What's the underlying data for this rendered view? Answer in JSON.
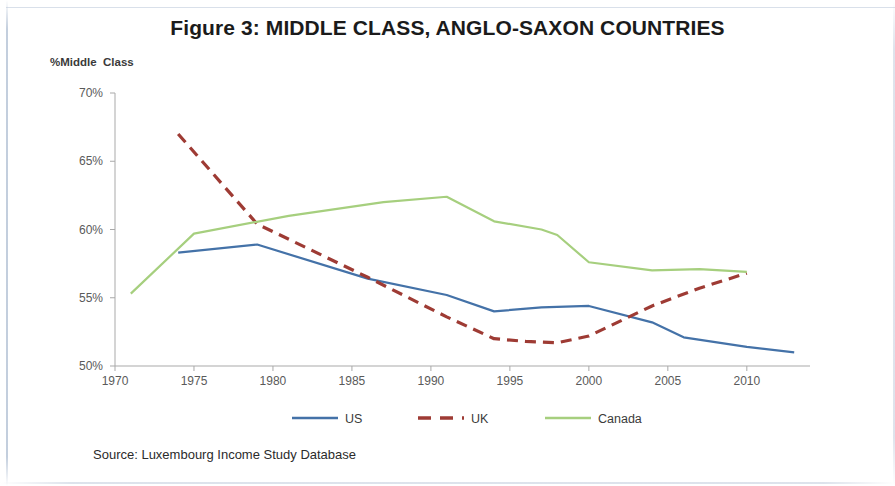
{
  "figure": {
    "title": "Figure 3: MIDDLE CLASS, ANGLO-SAXON COUNTRIES",
    "source": "Source: Luxembourg Income Study Database",
    "y_axis_title": "%Middle  Class"
  },
  "chart_data": {
    "type": "line",
    "title": "Figure 3: MIDDLE CLASS, ANGLO-SAXON COUNTRIES",
    "xlabel": "",
    "ylabel": "%Middle  Class",
    "xlim": [
      1969,
      2014
    ],
    "ylim": [
      50,
      70
    ],
    "grid": false,
    "legend_position": "bottom",
    "x_ticks": [
      "1970",
      "1975",
      "1980",
      "1985",
      "1990",
      "1995",
      "2000",
      "2005",
      "2010"
    ],
    "x_tick_values": [
      1970,
      1975,
      1980,
      1985,
      1990,
      1995,
      2000,
      2005,
      2010
    ],
    "y_ticks": [
      "50%",
      "55%",
      "60%",
      "65%",
      "70%"
    ],
    "y_tick_values": [
      50,
      55,
      60,
      65,
      70
    ],
    "series": [
      {
        "name": "US",
        "color": "#4472a8",
        "style": "solid",
        "x": [
          1974,
          1979,
          1986,
          1991,
          1994,
          1997,
          2000,
          2004,
          2006,
          2010,
          2013
        ],
        "values": [
          58.3,
          58.9,
          56.4,
          55.2,
          54.0,
          54.3,
          54.4,
          53.2,
          52.1,
          51.4,
          51.0
        ]
      },
      {
        "name": "UK",
        "color": "#9e3b34",
        "style": "dashed",
        "x": [
          1974,
          1979,
          1986,
          1991,
          1994,
          1996,
          1998,
          2000,
          2004,
          2007,
          2010
        ],
        "values": [
          67.0,
          60.4,
          56.5,
          53.6,
          52.0,
          51.8,
          51.7,
          52.2,
          54.4,
          55.7,
          56.8
        ]
      },
      {
        "name": "Canada",
        "color": "#a6cf7e",
        "style": "solid",
        "x": [
          1971,
          1975,
          1981,
          1987,
          1991,
          1994,
          1997,
          1998,
          2000,
          2004,
          2007,
          2010
        ],
        "values": [
          55.3,
          59.7,
          61.0,
          62.0,
          62.4,
          60.6,
          60.0,
          59.6,
          57.6,
          57.0,
          57.1,
          56.9
        ]
      }
    ]
  }
}
